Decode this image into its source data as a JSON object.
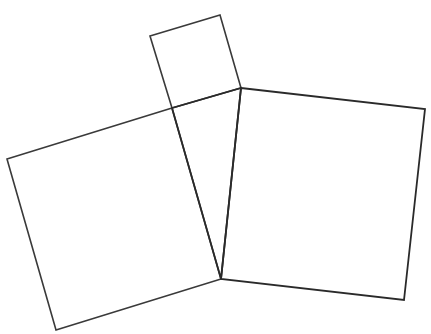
{
  "diagram": {
    "title": "",
    "stroke_color": "#3a3a3a",
    "background": "#ffffff",
    "shapes": [
      {
        "name": "small-square",
        "points": "150,36 220,15 241,88 172,108",
        "stroke_width": 1.6
      },
      {
        "name": "left-square",
        "points": "7,159 172,108 221,279 56,330",
        "stroke_width": 1.6
      },
      {
        "name": "right-square",
        "points": "241,88 425,109 404,300 221,279",
        "stroke_width": 1.8
      },
      {
        "name": "triangle",
        "points": "172,108 241,88 221,279",
        "stroke_width": 1.8
      }
    ]
  }
}
